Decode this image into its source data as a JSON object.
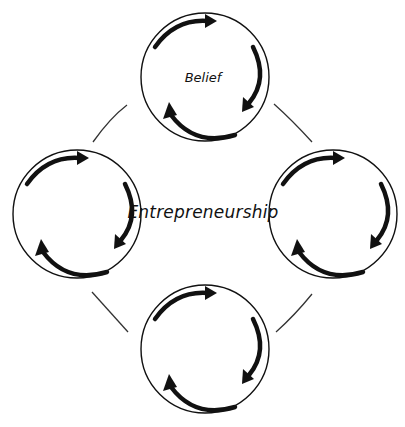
{
  "diagram": {
    "center_label": "Entrepreneurship",
    "nodes": [
      {
        "id": "top",
        "label": "Belief",
        "cx": 205,
        "cy": 77
      },
      {
        "id": "left",
        "label": "",
        "cx": 77,
        "cy": 214
      },
      {
        "id": "right",
        "label": "",
        "cx": 333,
        "cy": 214
      },
      {
        "id": "bottom",
        "label": "",
        "cx": 205,
        "cy": 349
      }
    ],
    "node_radius": 64,
    "colors": {
      "stroke": "#111111",
      "connector": "#333333",
      "background": "#ffffff"
    }
  }
}
